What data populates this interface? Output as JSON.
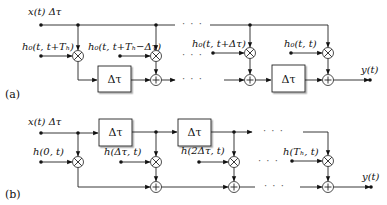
{
  "diagram": {
    "panel_a": {
      "label": "(a)",
      "input_label": "x(t) Δτ",
      "coefficients": [
        "h₀(t, t+Tₕ)",
        "h₀(t, t+Tₕ−Δτ)",
        "h₀(t, t+Δτ)",
        "h₀(t, t)"
      ],
      "delay_label": "Δτ",
      "output_label": "y(t)",
      "ellipsis": "· · ·"
    },
    "panel_b": {
      "label": "(b)",
      "input_label": "x(t) Δτ",
      "coefficients": [
        "h(0, t)",
        "h(Δτ, t)",
        "h(2Δτ, t)",
        "h(Tₕ, t)"
      ],
      "delay_label": "Δτ",
      "output_label": "y(t)",
      "ellipsis": "· · ·"
    },
    "symbols": {
      "multiplier": "×",
      "adder": "+"
    }
  }
}
